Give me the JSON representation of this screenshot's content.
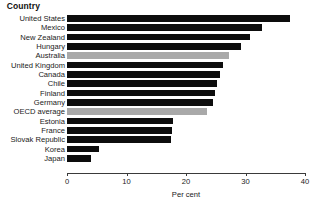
{
  "header": {
    "country_column_label": "Country"
  },
  "axis": {
    "xlabel": "Per cent",
    "tick_labels": [
      "0",
      "10",
      "20",
      "30",
      "40"
    ]
  },
  "chart_data": {
    "type": "bar",
    "orientation": "horizontal",
    "title": "",
    "subtitle": "",
    "xlabel": "Per cent",
    "ylabel": "Country",
    "xlim": [
      0,
      40
    ],
    "xticks": [
      0,
      10,
      20,
      30,
      40
    ],
    "grid": false,
    "legend": "none",
    "colors": {
      "bar": "#0d0d0d",
      "highlight": "#a9a9a9",
      "background": "#ffffff",
      "axis": "#3a3a3a",
      "text": "#1a1a1a"
    },
    "categories": [
      "United States",
      "Mexico",
      "New Zealand",
      "Hungary",
      "Australia",
      "United Kingdom",
      "Canada",
      "Chile",
      "Finland",
      "Germany",
      "OECD average",
      "Estonia",
      "France",
      "Slovak Republic",
      "Korea",
      "Japan"
    ],
    "values": [
      37.5,
      32.7,
      30.8,
      29.3,
      27.2,
      26.2,
      25.7,
      25.2,
      24.8,
      24.5,
      23.5,
      17.8,
      17.6,
      17.5,
      5.3,
      4.0
    ],
    "highlighted": [
      "Australia",
      "OECD average"
    ],
    "bars": [
      {
        "category": "United States",
        "value": 37.5,
        "highlight": false
      },
      {
        "category": "Mexico",
        "value": 32.7,
        "highlight": false
      },
      {
        "category": "New Zealand",
        "value": 30.8,
        "highlight": false
      },
      {
        "category": "Hungary",
        "value": 29.3,
        "highlight": false
      },
      {
        "category": "Australia",
        "value": 27.2,
        "highlight": true
      },
      {
        "category": "United Kingdom",
        "value": 26.2,
        "highlight": false
      },
      {
        "category": "Canada",
        "value": 25.7,
        "highlight": false
      },
      {
        "category": "Chile",
        "value": 25.2,
        "highlight": false
      },
      {
        "category": "Finland",
        "value": 24.8,
        "highlight": false
      },
      {
        "category": "Germany",
        "value": 24.5,
        "highlight": false
      },
      {
        "category": "OECD average",
        "value": 23.5,
        "highlight": true
      },
      {
        "category": "Estonia",
        "value": 17.8,
        "highlight": false
      },
      {
        "category": "France",
        "value": 17.6,
        "highlight": false
      },
      {
        "category": "Slovak Republic",
        "value": 17.5,
        "highlight": false
      },
      {
        "category": "Korea",
        "value": 5.3,
        "highlight": false
      },
      {
        "category": "Japan",
        "value": 4.0,
        "highlight": false
      }
    ]
  }
}
